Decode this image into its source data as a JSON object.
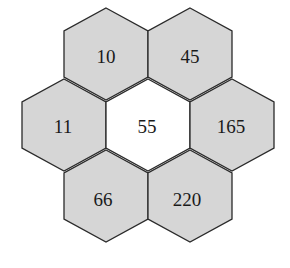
{
  "diagram": {
    "type": "hexagon-ring-puzzle",
    "center": {
      "label": "55",
      "fill": "#ffffff"
    },
    "ring": [
      {
        "position": "top-left",
        "label": "10"
      },
      {
        "position": "top-right",
        "label": "45"
      },
      {
        "position": "right",
        "label": "165"
      },
      {
        "position": "bottom-right",
        "label": "220"
      },
      {
        "position": "bottom-left",
        "label": "66"
      },
      {
        "position": "left",
        "label": "11"
      }
    ],
    "colors": {
      "shaded_fill": "#d6d6d6",
      "stroke": "#2a2a2a"
    }
  }
}
